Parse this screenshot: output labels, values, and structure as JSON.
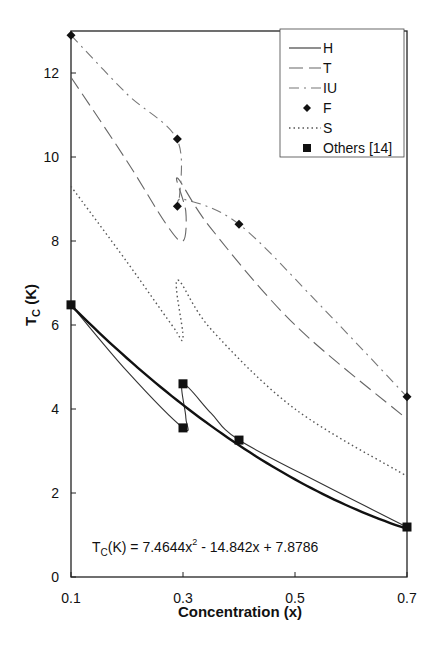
{
  "chart_data": {
    "type": "line",
    "title": "",
    "xlabel": "Concentration (x)",
    "ylabel": "T",
    "ylabel_sub": "C",
    "ylabel_suffix": " (K)",
    "xlim": [
      0.1,
      0.7
    ],
    "ylim": [
      0,
      13
    ],
    "xticks": [
      "0.1",
      "0.3",
      "0.5",
      "0.7"
    ],
    "yticks": [
      "0",
      "2",
      "4",
      "6",
      "8",
      "10",
      "12"
    ],
    "grid": false,
    "legend_position": "upper right",
    "equation": {
      "prefix": "T",
      "sub": "C",
      "mid": "(K) = 7.4644x",
      "sup": "2",
      "rest": " - 14.842x + 7.8786"
    },
    "series": [
      {
        "name": "H",
        "style": "solid-thin",
        "points": [
          [
            0.1,
            6.48
          ],
          [
            0.2,
            4.9
          ],
          [
            0.3,
            3.55
          ],
          [
            0.305,
            3.8
          ],
          [
            0.3,
            4.6
          ],
          [
            0.35,
            3.9
          ],
          [
            0.4,
            3.26
          ],
          [
            0.55,
            2.2
          ],
          [
            0.7,
            1.19
          ]
        ]
      },
      {
        "name": "T",
        "style": "long-dash",
        "points": [
          [
            0.1,
            11.9
          ],
          [
            0.2,
            9.9
          ],
          [
            0.27,
            8.4
          ],
          [
            0.3,
            8.0
          ],
          [
            0.305,
            8.7
          ],
          [
            0.29,
            9.5
          ],
          [
            0.35,
            8.3
          ],
          [
            0.5,
            6.0
          ],
          [
            0.7,
            3.76
          ]
        ]
      },
      {
        "name": "IU",
        "style": "dash-dot",
        "points": [
          [
            0.1,
            12.9
          ],
          [
            0.2,
            11.5
          ],
          [
            0.29,
            10.4
          ],
          [
            0.293,
            8.83
          ],
          [
            0.3,
            9.0
          ],
          [
            0.4,
            8.4
          ],
          [
            0.55,
            6.4
          ],
          [
            0.7,
            4.29
          ]
        ]
      },
      {
        "name": "F",
        "style": "diamond-markers",
        "points": [
          [
            0.1,
            12.9
          ],
          [
            0.29,
            10.43
          ],
          [
            0.29,
            8.83
          ],
          [
            0.4,
            8.4
          ],
          [
            0.7,
            4.29
          ]
        ]
      },
      {
        "name": "S",
        "style": "dotted",
        "points": [
          [
            0.1,
            9.3
          ],
          [
            0.2,
            7.5
          ],
          [
            0.28,
            6.0
          ],
          [
            0.3,
            5.7
          ],
          [
            0.29,
            7.07
          ],
          [
            0.35,
            5.9
          ],
          [
            0.5,
            4.0
          ],
          [
            0.7,
            2.4
          ]
        ]
      },
      {
        "name": "Others [14]",
        "style": "square-markers",
        "points": [
          [
            0.1,
            6.48
          ],
          [
            0.3,
            4.6
          ],
          [
            0.3,
            3.55
          ],
          [
            0.4,
            3.26
          ],
          [
            0.7,
            1.19
          ]
        ]
      },
      {
        "name": "fit",
        "style": "solid-thick",
        "formula": "7.4644x^2 - 14.842x + 7.8786"
      }
    ],
    "legend": [
      "H",
      "T",
      "IU",
      "F",
      "S",
      "Others [14]"
    ]
  }
}
